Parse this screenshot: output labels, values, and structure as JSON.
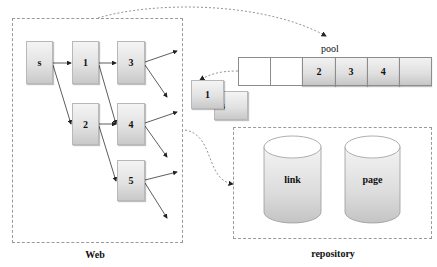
{
  "web": {
    "label": "Web",
    "nodes": [
      {
        "id": "s",
        "label": "s"
      },
      {
        "id": "1",
        "label": "1"
      },
      {
        "id": "2",
        "label": "2"
      },
      {
        "id": "3",
        "label": "3"
      },
      {
        "id": "4",
        "label": "4"
      },
      {
        "id": "5",
        "label": "5"
      }
    ],
    "edges": [
      [
        "s",
        "1"
      ],
      [
        "s",
        "2"
      ],
      [
        "1",
        "3"
      ],
      [
        "1",
        "4"
      ],
      [
        "2",
        "4"
      ],
      [
        "2",
        "5"
      ]
    ]
  },
  "pool": {
    "label": "pool",
    "cells": [
      "",
      "",
      "2",
      "3",
      "4",
      ""
    ]
  },
  "popped": {
    "items": [
      "1",
      "s"
    ]
  },
  "repository": {
    "label": "repository",
    "stores": [
      {
        "label": "link"
      },
      {
        "label": "page"
      }
    ]
  },
  "colors": {
    "box_top": "#f4f4f4",
    "box_bottom": "#c9c9c9",
    "border": "#9a9a9a",
    "text": "#111111"
  }
}
